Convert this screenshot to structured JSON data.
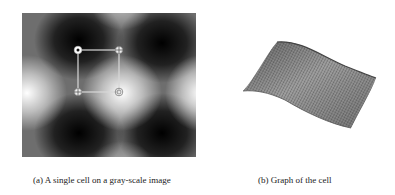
{
  "figure": {
    "panel_a": {
      "caption": "(a) A single cell on a gray-scale image",
      "description": "Gray-scale image with periodic dark and bright blobs; a square cell outlined with four corner markers",
      "cell": {
        "corners": [
          {
            "name": "top-left",
            "marker": "dot"
          },
          {
            "name": "top-right",
            "marker": "crosshair"
          },
          {
            "name": "bottom-left",
            "marker": "crosshair"
          },
          {
            "name": "bottom-right",
            "marker": "ring"
          }
        ],
        "line_color": "#d8d8d8"
      }
    },
    "panel_b": {
      "caption": "(b) Graph of the cell",
      "description": "3D wireframe surface plot of the cell intensity"
    }
  }
}
